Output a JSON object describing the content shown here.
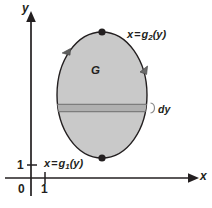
{
  "figure": {
    "background_color": "#ffffff",
    "ink_color": "#231f20",
    "region_fill_color": "#c9c9c9",
    "region_stroke_color": "#231f20",
    "strip_fill_color": "#b0b0b0",
    "strip_edge_color": "#8a8a8a"
  },
  "axes": {
    "x_axis_label": "x",
    "y_axis_label": "y",
    "origin_label": "0",
    "x_tick_label": "1",
    "y_tick_label": "1",
    "x_axis_y_px": 178,
    "y_axis_x_px": 31,
    "x_tick_x_px": 45,
    "y_tick_y_px": 165,
    "arrowheads": [
      "x-axis-right",
      "y-axis-up"
    ]
  },
  "region": {
    "label": "G",
    "center_x_px": 102,
    "center_y_px": 95,
    "radius_x_px": 45,
    "radius_y_px": 63
  },
  "curves": {
    "right_boundary": {
      "label_x": "x",
      "label_eq": "=",
      "label_fn": "g",
      "label_sub": "2",
      "label_arg": "(y)"
    },
    "left_boundary": {
      "label_x": "x",
      "label_eq": "=",
      "label_fn": "g",
      "label_sub": "1",
      "label_arg": "(y)"
    }
  },
  "strip": {
    "label": "dy",
    "bracket_glyph": "}",
    "top_y_px": 104,
    "bottom_y_px": 112
  },
  "markers": {
    "top_vertex": {
      "x_px": 102,
      "y_px": 32,
      "shape": "filled-dot"
    },
    "bottom_vertex": {
      "x_px": 102,
      "y_px": 158,
      "shape": "filled-dot"
    },
    "orientation_arrow_upper_left": "down-left",
    "orientation_arrow_right": "up-right"
  }
}
